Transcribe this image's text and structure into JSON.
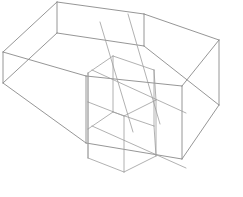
{
  "figure": {
    "title": "Wireframe Hexagonal Prisms",
    "background_color": "#ffffff",
    "stroke_color": "#8a8a8a",
    "stroke_color_soft": "#9d9d9d",
    "stroke_width": "0.9",
    "width": 243,
    "height": 197,
    "large_prism": {
      "name": "large-hexagonal-prism",
      "top_face_points": "57,2 144,14 219,40 182,86 86,76 3,52",
      "bottom_face_points": "57,33 144,46 219,105 182,159 86,143 3,83",
      "vertical_edges": [
        "57,2 57,33",
        "144,14 144,46",
        "219,40 219,105",
        "182,86 182,159",
        "86,76 86,143",
        "3,52 3,83"
      ],
      "inner_wall_points": "57,33 144,46 219,105 182,159 86,143 3,83"
    },
    "small_prism": {
      "name": "small-hexagonal-prism",
      "top_face_points": "113,56 154,70 156,100 124,116 88,102 88,73",
      "bottom_face_points": "113,112 154,126 156,156 124,172 88,158 88,129",
      "vertical_edges": [
        "113,56 113,112",
        "154,70 154,126",
        "156,100 156,156",
        "124,116 124,172",
        "88,102 88,158",
        "88,73 88,129"
      ]
    },
    "cross_lines": [
      "100,22 133,132",
      "128,14 160,124",
      "92,70 186,113",
      "92,126 186,168"
    ]
  }
}
